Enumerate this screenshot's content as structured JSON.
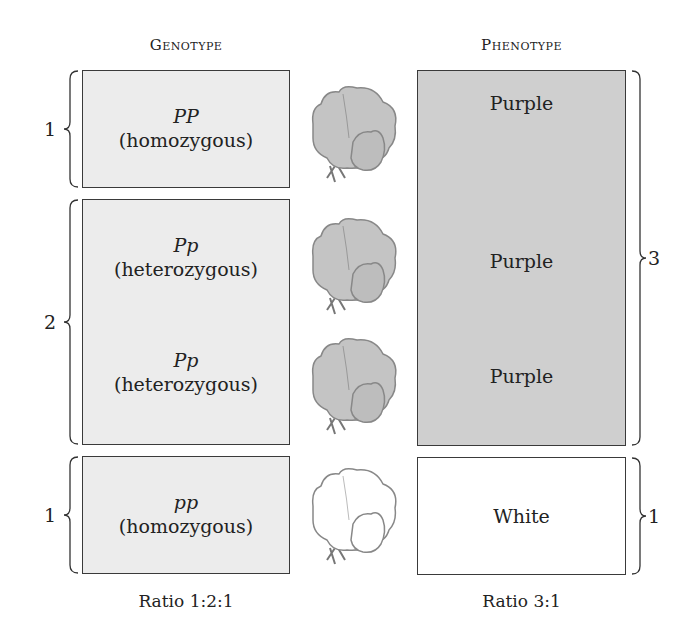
{
  "headers": {
    "genotype": "Genotype",
    "phenotype": "Phenotype"
  },
  "genotype": {
    "rows": [
      {
        "symbol": "PP",
        "label": "(homozygous)",
        "count": "1"
      },
      {
        "symbol": "Pp",
        "label": "(heterozygous)",
        "count": "2"
      },
      {
        "symbol": "Pp",
        "label": "(heterozygous)"
      },
      {
        "symbol": "pp",
        "label": "(homozygous)",
        "count": "1"
      }
    ],
    "ratio": "Ratio 1:2:1"
  },
  "phenotype": {
    "rows": [
      {
        "label": "Purple"
      },
      {
        "label": "Purple"
      },
      {
        "label": "Purple"
      },
      {
        "label": "White"
      }
    ],
    "counts": {
      "purple": "3",
      "white": "1"
    },
    "ratio": "Ratio 3:1"
  },
  "flowers": [
    {
      "color": "purple",
      "icon": "sweet-pea-flower-icon"
    },
    {
      "color": "purple",
      "icon": "sweet-pea-flower-icon"
    },
    {
      "color": "purple",
      "icon": "sweet-pea-flower-icon"
    },
    {
      "color": "white",
      "icon": "sweet-pea-flower-icon"
    }
  ],
  "colors": {
    "genotype_fill": "#ececec",
    "purple_fill": "#cfcfcf",
    "white_fill": "#ffffff",
    "stroke": "#3a3a3a"
  }
}
